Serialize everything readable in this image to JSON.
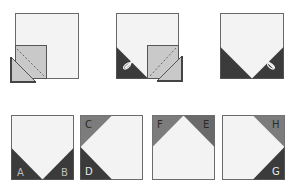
{
  "colors": {
    "background": "#ffffff",
    "square_fill": "#f3f3f3",
    "outline": "#6a6a6a",
    "overlay_fill": "#c9c9c9",
    "dark": "#3b3b3b",
    "medium": "#7c7c7c",
    "label_on_dark": "#e8e8e8",
    "label_on_medium": "#2a2a2a"
  },
  "steps": [
    {
      "id": "step-1",
      "description": "Small square placed on lower-left corner with diagonal stitch line; cut triangle below"
    },
    {
      "id": "step-2",
      "description": "Lower-left corner folded dark; second small square placed on lower-right with scissors"
    },
    {
      "id": "step-3",
      "description": "Both lower corners dark triangles; scissors trimming"
    }
  ],
  "result_blocks": [
    {
      "id": "block-ab",
      "labels": [
        "A",
        "B"
      ]
    },
    {
      "id": "block-cd",
      "labels": [
        "C",
        "D"
      ]
    },
    {
      "id": "block-fe",
      "labels": [
        "F",
        "E"
      ]
    },
    {
      "id": "block-hg",
      "labels": [
        "H",
        "G"
      ]
    }
  ]
}
